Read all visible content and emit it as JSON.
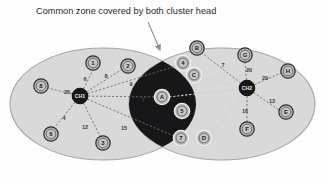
{
  "figure": {
    "caption": "Common zone covered by both cluster head",
    "background_color": "#fefefe",
    "cluster_fill": "#d9d9d9",
    "cluster_stroke": "#9a9a9a",
    "overlap_fill": "#17171a",
    "node_fill": "#b8b8b8",
    "node_stroke": "#2a2a2a",
    "cluster_head_fill": "#17171a",
    "edge_color": "#6e6e6e"
  },
  "clusters": [
    {
      "id": "left-cluster",
      "label": "",
      "cx": 103,
      "cy": 104,
      "rx": 93,
      "ry": 56
    },
    {
      "id": "right-cluster",
      "label": "",
      "cx": 222,
      "cy": 104,
      "rx": 93,
      "ry": 56
    }
  ],
  "overlap_zone": {
    "id": "common-zone",
    "label": "Common zone covered by both cluster head"
  },
  "cluster_heads": [
    {
      "id": "ch1",
      "label": "CH1",
      "x": 80,
      "y": 96
    },
    {
      "id": "ch2",
      "label": "CH2",
      "x": 247,
      "y": 88
    }
  ],
  "nodes": [
    {
      "id": "n1",
      "label": "1",
      "x": 93,
      "y": 63,
      "zone": "light"
    },
    {
      "id": "n2",
      "label": "2",
      "x": 128,
      "y": 66,
      "zone": "light"
    },
    {
      "id": "n8",
      "label": "8",
      "x": 41,
      "y": 86,
      "zone": "light"
    },
    {
      "id": "n6",
      "label": "6",
      "x": 51,
      "y": 134,
      "zone": "light"
    },
    {
      "id": "n3",
      "label": "3",
      "x": 103,
      "y": 143,
      "zone": "light"
    },
    {
      "id": "n4",
      "label": "4",
      "x": 183,
      "y": 63,
      "zone": "dark"
    },
    {
      "id": "nC",
      "label": "C",
      "x": 194,
      "y": 75,
      "zone": "dark"
    },
    {
      "id": "nA",
      "label": "A",
      "x": 162,
      "y": 97,
      "zone": "dark"
    },
    {
      "id": "n5",
      "label": "5",
      "x": 182,
      "y": 111,
      "zone": "dark"
    },
    {
      "id": "n7",
      "label": "7",
      "x": 181,
      "y": 138,
      "zone": "dark"
    },
    {
      "id": "nD",
      "label": "D",
      "x": 204,
      "y": 138,
      "zone": "dark"
    },
    {
      "id": "nB",
      "label": "B",
      "x": 197,
      "y": 48,
      "zone": "light"
    },
    {
      "id": "nG",
      "label": "G",
      "x": 245,
      "y": 55,
      "zone": "light"
    },
    {
      "id": "nH",
      "label": "H",
      "x": 288,
      "y": 71,
      "zone": "light"
    },
    {
      "id": "nE",
      "label": "E",
      "x": 286,
      "y": 112,
      "zone": "light"
    },
    {
      "id": "nF",
      "label": "F",
      "x": 247,
      "y": 129,
      "zone": "light"
    }
  ],
  "edges": [
    {
      "id": "e-ch1-n1",
      "from": "ch1",
      "to": "n1",
      "weight": "6",
      "lx": 85,
      "ly": 79,
      "tone": "dark"
    },
    {
      "id": "e-ch1-n2",
      "from": "ch1",
      "to": "n2",
      "weight": "8",
      "lx": 106,
      "ly": 76,
      "tone": "dark"
    },
    {
      "id": "e-ch1-n8",
      "from": "ch1",
      "to": "n8",
      "weight": "25",
      "lx": 67,
      "ly": 92,
      "tone": "dark"
    },
    {
      "id": "e-ch1-n6",
      "from": "ch1",
      "to": "n6",
      "weight": "4",
      "lx": 64,
      "ly": 118,
      "tone": "dark"
    },
    {
      "id": "e-ch1-n3",
      "from": "ch1",
      "to": "n3",
      "weight": "12",
      "lx": 85,
      "ly": 127,
      "tone": "dark"
    },
    {
      "id": "e-ch1-n4",
      "from": "ch1",
      "to": "n4",
      "weight": "9",
      "lx": 131,
      "ly": 84,
      "tone": "dark"
    },
    {
      "id": "e-ch1-nA",
      "from": "ch1",
      "to": "nA",
      "weight": "7",
      "lx": 143,
      "ly": 100,
      "tone": "dark"
    },
    {
      "id": "e-ch1-n7",
      "from": "ch1",
      "to": "n7",
      "weight": "15",
      "lx": 124,
      "ly": 128,
      "tone": "dark"
    },
    {
      "id": "e-ch2-nB",
      "from": "ch2",
      "to": "nB",
      "weight": "7",
      "lx": 223,
      "ly": 65,
      "tone": "dark"
    },
    {
      "id": "e-ch2-nG",
      "from": "ch2",
      "to": "nG",
      "weight": "20",
      "lx": 249,
      "ly": 70,
      "tone": "dark"
    },
    {
      "id": "e-ch2-nH",
      "from": "ch2",
      "to": "nH",
      "weight": "29",
      "lx": 265,
      "ly": 78,
      "tone": "dark"
    },
    {
      "id": "e-ch2-nE",
      "from": "ch2",
      "to": "nE",
      "weight": "13",
      "lx": 272,
      "ly": 101,
      "tone": "dark"
    },
    {
      "id": "e-ch2-nF",
      "from": "ch2",
      "to": "nF",
      "weight": "16",
      "lx": 245,
      "ly": 111,
      "tone": "dark"
    },
    {
      "id": "e-ch2-nC",
      "from": "ch2",
      "to": "nC",
      "weight": "2",
      "lx": 214,
      "ly": 79,
      "tone": "light"
    },
    {
      "id": "e-ch2-nA",
      "from": "ch2",
      "to": "nA",
      "weight": "6",
      "lx": 210,
      "ly": 94,
      "tone": "light"
    },
    {
      "id": "e-ch2-nD",
      "from": "ch2",
      "to": "nD",
      "weight": "19",
      "lx": 214,
      "ly": 114,
      "tone": "light"
    }
  ],
  "annotation": {
    "pointer_label": "Common zone covered by both cluster head",
    "pointer_from_x": 148,
    "pointer_from_y": 22,
    "pointer_to_x": 161,
    "pointer_to_y": 53
  }
}
